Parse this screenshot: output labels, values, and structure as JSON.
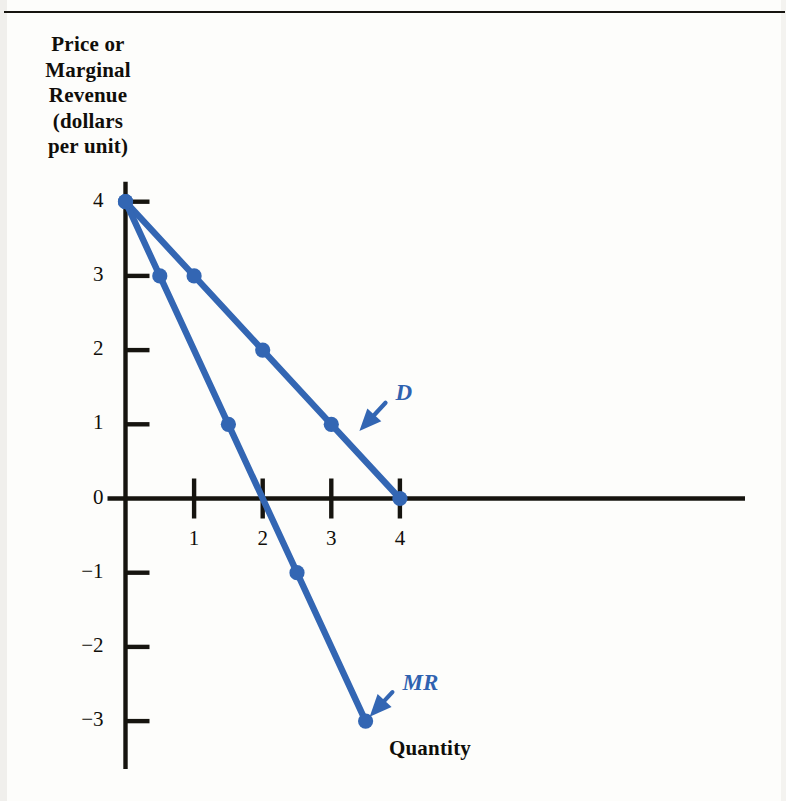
{
  "figure": {
    "y_axis_title": "Price or\nMarginal\nRevenue\n(dollars\nper unit)",
    "y_axis_title_lines": [
      "Price or",
      "Marginal",
      "Revenue",
      "(dollars",
      "per unit)"
    ],
    "x_axis_title": "Quantity",
    "top_rule": "horizontal-rule"
  },
  "labels": {
    "demand": "D",
    "marginal_revenue": "MR"
  },
  "colors": {
    "series_blue": "#3366b3",
    "axis_black": "#16140f",
    "page_background": "#fdfdfb"
  },
  "chart_data": {
    "type": "line",
    "title": "",
    "xlabel": "Quantity",
    "ylabel": "Price or Marginal Revenue (dollars per unit)",
    "xlim": [
      0,
      4.55
    ],
    "ylim": [
      -3.35,
      4
    ],
    "grid": false,
    "legend": "inline-annotations",
    "xticks": [
      1,
      2,
      3,
      4
    ],
    "xtick_labels": [
      "1",
      "2",
      "3",
      "4"
    ],
    "yticks": [
      4,
      3,
      2,
      1,
      0,
      -1,
      -2,
      -3
    ],
    "ytick_labels": [
      "4",
      "3",
      "2",
      "1",
      "0",
      "−1",
      "−2",
      "−3"
    ],
    "series": [
      {
        "name": "D",
        "label": "D",
        "color": "#3366b3",
        "markers": true,
        "x": [
          0,
          1,
          2,
          3,
          4
        ],
        "y": [
          4,
          3,
          2,
          1,
          0
        ]
      },
      {
        "name": "MR",
        "label": "MR",
        "color": "#3366b3",
        "markers": true,
        "x": [
          0,
          0.5,
          1.5,
          2.5,
          3.5
        ],
        "y": [
          4,
          3,
          1,
          -1,
          -3
        ]
      }
    ],
    "annotations": [
      {
        "text": "D",
        "points_to": {
          "x": 3.35,
          "y": 0.85
        },
        "text_at": {
          "x": 3.85,
          "y": 1.35
        }
      },
      {
        "text": "MR",
        "points_to": {
          "x": 3.5,
          "y": -3.0
        },
        "text_at": {
          "x": 3.95,
          "y": -2.55
        }
      }
    ]
  }
}
